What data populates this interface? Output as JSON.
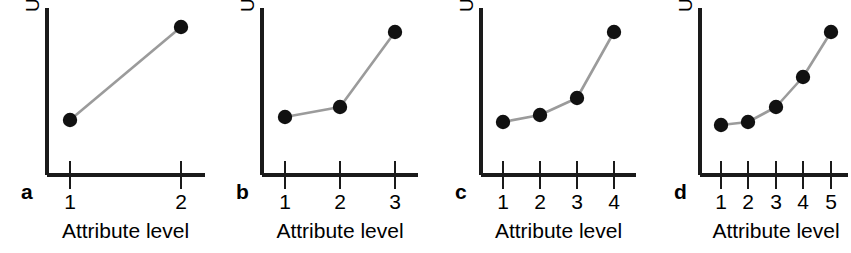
{
  "figure": {
    "background_color": "#ffffff",
    "axis_color": "#1a1a1a",
    "line_color": "#9b9b9b",
    "marker_color": "#111111"
  },
  "panels": [
    {
      "letter": "a",
      "ylabel": "Utility",
      "xlabel": "Attribute level",
      "tick_labels": [
        "1",
        "2"
      ],
      "origin_x": 47,
      "origin_y": 175,
      "axis_top_y": 8,
      "axis_right_x": 205,
      "tick_x": [
        70,
        181
      ],
      "point_y": [
        120,
        27
      ]
    },
    {
      "letter": "b",
      "ylabel": "Utility",
      "xlabel": "Attribute level",
      "tick_labels": [
        "1",
        "2",
        "3"
      ],
      "origin_x": 262,
      "origin_y": 175,
      "axis_top_y": 8,
      "axis_right_x": 418,
      "tick_x": [
        285,
        340,
        395
      ],
      "point_y": [
        117,
        107,
        32
      ]
    },
    {
      "letter": "c",
      "ylabel": "Utility",
      "xlabel": "Attribute level",
      "tick_labels": [
        "1",
        "2",
        "3",
        "4"
      ],
      "origin_x": 481,
      "origin_y": 175,
      "axis_top_y": 8,
      "axis_right_x": 636,
      "tick_x": [
        503,
        540,
        577,
        614
      ],
      "point_y": [
        122,
        115,
        98,
        32
      ]
    },
    {
      "letter": "d",
      "ylabel": "Utility",
      "xlabel": "Attribute level",
      "tick_labels": [
        "1",
        "2",
        "3",
        "4",
        "5"
      ],
      "origin_x": 700,
      "origin_y": 175,
      "axis_top_y": 8,
      "axis_right_x": 848,
      "tick_x": [
        721,
        748,
        776,
        803,
        831
      ],
      "point_y": [
        125,
        122,
        107,
        77,
        32
      ]
    }
  ],
  "chart_data": [
    {
      "type": "line",
      "panel": "a",
      "title": "",
      "xlabel": "Attribute level",
      "ylabel": "Utility",
      "categories": [
        "1",
        "2"
      ],
      "x": [
        1,
        2
      ],
      "values": [
        0.33,
        1.0
      ],
      "xtick_labels": [
        "1",
        "2"
      ],
      "ytick_labels": [],
      "grid": false,
      "legend": "none",
      "markers": true,
      "note": "Two-level attribute: linear increase from low to high utility"
    },
    {
      "type": "line",
      "panel": "b",
      "title": "",
      "xlabel": "Attribute level",
      "ylabel": "Utility",
      "categories": [
        "1",
        "2",
        "3"
      ],
      "x": [
        1,
        2,
        3
      ],
      "values": [
        0.35,
        0.41,
        0.86
      ],
      "xtick_labels": [
        "1",
        "2",
        "3"
      ],
      "ytick_labels": [],
      "grid": false,
      "legend": "none",
      "markers": true,
      "note": "Three-level attribute: shallow then steep increase"
    },
    {
      "type": "line",
      "panel": "c",
      "title": "",
      "xlabel": "Attribute level",
      "ylabel": "Utility",
      "categories": [
        "1",
        "2",
        "3",
        "4"
      ],
      "x": [
        1,
        2,
        3,
        4
      ],
      "values": [
        0.32,
        0.36,
        0.46,
        0.86
      ],
      "xtick_labels": [
        "1",
        "2",
        "3",
        "4"
      ],
      "ytick_labels": [],
      "grid": false,
      "legend": "none",
      "markers": true,
      "note": "Four-level attribute: convex increasing utility curve"
    },
    {
      "type": "line",
      "panel": "d",
      "title": "",
      "xlabel": "Attribute level",
      "ylabel": "Utility",
      "categories": [
        "1",
        "2",
        "3",
        "4",
        "5"
      ],
      "x": [
        1,
        2,
        3,
        4,
        5
      ],
      "values": [
        0.3,
        0.32,
        0.41,
        0.59,
        0.86
      ],
      "xtick_labels": [
        "1",
        "2",
        "3",
        "4",
        "5"
      ],
      "ytick_labels": [],
      "grid": false,
      "legend": "none",
      "markers": true,
      "note": "Five-level attribute: smooth convex increasing utility curve"
    }
  ]
}
